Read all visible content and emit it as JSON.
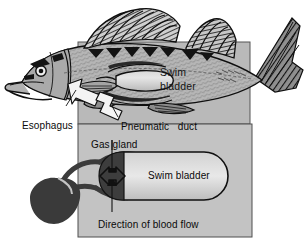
{
  "figure": {
    "width": 305,
    "height": 247,
    "background_color": "#ffffff"
  },
  "panels": {
    "upper": {
      "name": "fish-body-panel",
      "fill_color": "#b8b8b8",
      "border_color": "#5a5a5a",
      "x": 78,
      "y": 42,
      "width": 172,
      "height": 82
    },
    "lower": {
      "name": "gas-gland-detail-panel",
      "fill_color": "#c2c2c2",
      "border_color": "#555555",
      "x": 78,
      "y": 124,
      "width": 174,
      "height": 113
    }
  },
  "colors": {
    "fish_body": "#b3b3b3",
    "fish_outline": "#1a1a1a",
    "dark_organ": "#3d3d3d",
    "rete_mirabile": "#3a3a3a",
    "swim_bladder_fill": "#c9c9c9",
    "swim_bladder_highlight": "#e2e2e2",
    "arrow_white": "#f2f2f2",
    "label_text": "#0a0a0a"
  },
  "labels": {
    "swim_bladder_fish_line1": "Swim",
    "swim_bladder_fish_line2": "bladder",
    "esophagus": "Esophagus",
    "pneumatic_duct": "Pneumatic   duct",
    "gas_gland": "Gas gland",
    "swim_bladder_detail": "Swim bladder",
    "direction_of_blood_flow": "Direction of blood flow"
  },
  "structures": {
    "fish": "lateral view line drawing of a perch-like fish with two dorsal fins, pectoral and pelvic fins, caudal fin, eye and open mouth",
    "swim_bladder_in_fish": "elongated pale oval organ inside body cavity",
    "pneumatic_duct_arrow": "white hollow tube connecting esophagus to swim bladder",
    "esophagus_arrow": "white hollow arrow pointing to the esophagus region",
    "gas_gland": "dark rounded cap at the left end of the detail swim bladder",
    "rete_mirabile": "dark teardrop blob of capillaries connected by vessel loops",
    "blood_flow_arrows": "double-headed vertical arrow through the gas gland and an outward horizontal double arrow"
  }
}
